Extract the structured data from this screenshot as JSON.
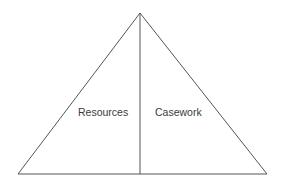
{
  "diagram": {
    "type": "divided-triangle",
    "stroke_color": "#555555",
    "background": "#ffffff",
    "sections": [
      {
        "label": "Resources",
        "position": "left"
      },
      {
        "label": "Casework",
        "position": "right"
      }
    ]
  }
}
